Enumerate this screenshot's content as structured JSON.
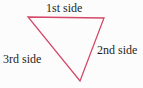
{
  "figure": {
    "background_color": "#fcfcfc",
    "text_color": "#1e1e1e",
    "triangle": {
      "points": "28,17 104,18 80,81",
      "stroke_color": "#d5486a",
      "stroke_width": "1.3",
      "fill": "none"
    },
    "labels": {
      "side1": "1st side",
      "side2": "2nd side",
      "side3": "3rd side"
    }
  }
}
